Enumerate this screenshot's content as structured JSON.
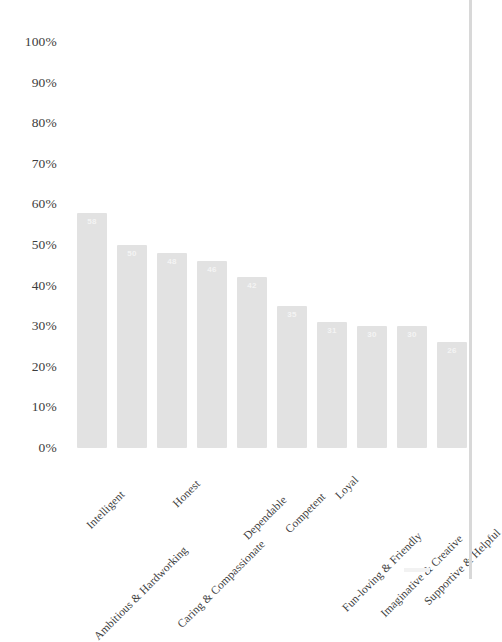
{
  "chart_data": {
    "type": "bar",
    "title": "",
    "subtitle": "",
    "xlabel": "",
    "ylabel": "",
    "ylim": [
      0,
      100
    ],
    "grid": false,
    "legend": null,
    "orientation": "vertical",
    "value_label_position": "inside-top",
    "categories": [
      "Intelligent",
      "Ambitious & Hardworking",
      "Honest",
      "Caring & Compassionate",
      "Dependable",
      "Competent",
      "Loyal",
      "Fun-loving & Friendly",
      "Imaginative & Creative",
      "Supportive & Helpful"
    ],
    "values": [
      58,
      50,
      48,
      46,
      42,
      35,
      31,
      30,
      30,
      26
    ],
    "value_labels": [
      "58",
      "50",
      "48",
      "46",
      "42",
      "35",
      "31",
      "30",
      "30",
      "26"
    ],
    "yticks": [
      0,
      10,
      20,
      30,
      40,
      50,
      60,
      70,
      80,
      90,
      100
    ],
    "ytick_labels": [
      "0%",
      "10%",
      "20%",
      "30%",
      "40%",
      "50%",
      "60%",
      "70%",
      "80%",
      "90%",
      "100%"
    ],
    "bar_color": "#e2e2e2",
    "value_label_color": "#f4f4f4",
    "axis_text_color": "#3d3d3d"
  }
}
